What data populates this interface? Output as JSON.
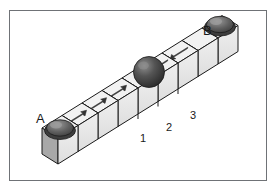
{
  "figure": {
    "background_color": "#ffffff",
    "frame_color": "#6f7276",
    "cube_top_color": "#f2f2f2",
    "cube_front_color": "#e8e8e8",
    "cube_side_color": "#a8a8a8",
    "cube_edge_color": "#1a1a1a",
    "sphere_color": "#4a4a4a",
    "arrow_color": "#333333"
  },
  "labels": {
    "start": "A",
    "end": "B",
    "marker_1": "1",
    "marker_2": "2",
    "marker_3": "3"
  },
  "scene": {
    "cube_count": 9,
    "spheres": [
      {
        "name": "sphere-a",
        "cube_index": 1,
        "style": "seated",
        "label": "A"
      },
      {
        "name": "sphere-center",
        "cube_index": 5,
        "style": "free",
        "label": ""
      },
      {
        "name": "sphere-b",
        "cube_index": 9,
        "style": "seated",
        "label": "B"
      }
    ],
    "arrows": [
      {
        "cube_index": 2,
        "direction": "right"
      },
      {
        "cube_index": 3,
        "direction": "right"
      },
      {
        "cube_index": 4,
        "direction": "right"
      },
      {
        "cube_index": 6,
        "direction": "left"
      },
      {
        "cube_index": 7,
        "direction": "left"
      }
    ]
  }
}
